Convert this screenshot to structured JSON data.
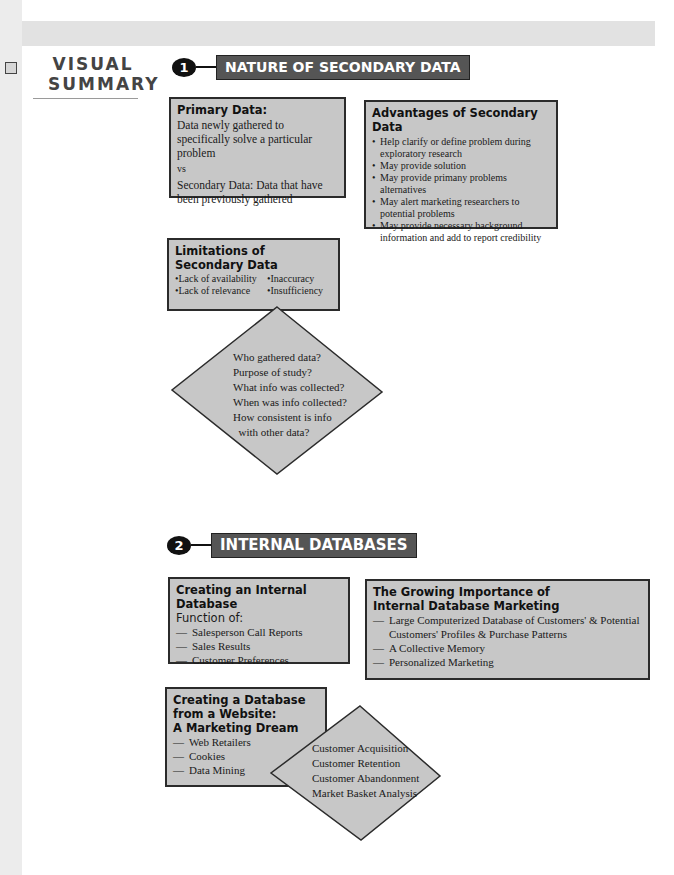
{
  "page": {
    "title_line1": "VISUAL",
    "title_line2": "SUMMARY"
  },
  "section1": {
    "number": "1",
    "heading": "NATURE OF SECONDARY DATA",
    "primary_box": {
      "title": "Primary Data:",
      "lines": [
        "Data newly gathered to specifically solve a particular problem",
        "vs",
        "Secondary Data: Data that have been previously gathered"
      ]
    },
    "advantages_box": {
      "title": "Advantages of Secondary Data",
      "items": [
        "Help clarify or define problem during exploratory research",
        "May provide solution",
        "May provide primany problems alternatives",
        "May alert marketing researchers to potential problems",
        "May provide necessary background information and add to report credibility"
      ]
    },
    "limitations_box": {
      "title_line1": "Limitations of",
      "title_line2": "Secondary Data",
      "items": [
        "Lack of availability",
        "Inaccuracy",
        "Lack of relevance",
        "Insufficiency"
      ]
    },
    "diamond": {
      "lines": [
        "Who gathered data?",
        "Purpose of study?",
        "What info was collected?",
        "When was info collected?",
        "How consistent is info",
        "  with other data?"
      ]
    }
  },
  "section2": {
    "number": "2",
    "heading": "INTERNAL DATABASES",
    "internal_box": {
      "title": "Creating an Internal Database",
      "subtitle": "Function of:",
      "items": [
        "Salesperson Call Reports",
        "Sales Results",
        "Customer Preferences"
      ]
    },
    "growing_box": {
      "title_line1": "The Growing Importance of",
      "title_line2": "Internal Database Marketing",
      "items": [
        "Large Computerized Database of Customers' & Potential Customers' Profiles & Purchase Patterns",
        "A Collective Memory",
        "Personalized Marketing"
      ]
    },
    "website_box": {
      "title_line1": "Creating a Database",
      "title_line2": "from a Website:",
      "title_line3": "A Marketing Dream",
      "items": [
        "Web Retailers",
        "Cookies",
        "Data Mining"
      ]
    },
    "diamond": {
      "lines": [
        "Customer Acquisition",
        "Customer Retention",
        "Customer Abandonment",
        "Market Basket Analysis"
      ]
    }
  },
  "colors": {
    "box_fill": "#c7c7c7",
    "box_border": "#2b2b2b",
    "heading_fill": "#555555",
    "badge_fill": "#111111",
    "band_gray": "#e2e2e2"
  }
}
